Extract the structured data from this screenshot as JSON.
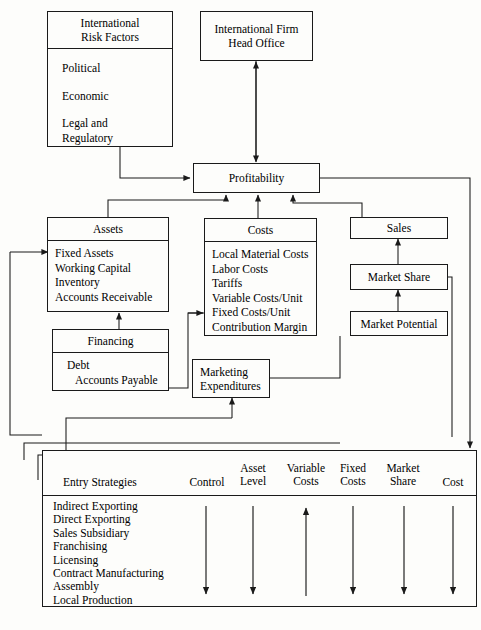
{
  "diagram": {
    "boxes": {
      "risk_factors": {
        "title": "International\nRisk Factors",
        "items": [
          "Political",
          "Economic",
          "Legal and\nRegulatory"
        ]
      },
      "head_office": {
        "label": "International Firm\nHead Office"
      },
      "profitability": {
        "label": "Profitability"
      },
      "assets": {
        "title": "Assets",
        "items": [
          "Fixed Assets",
          "Working Capital",
          "Inventory",
          "Accounts Receivable"
        ]
      },
      "financing": {
        "title": "Financing",
        "items": [
          "Debt",
          "Accounts Payable"
        ]
      },
      "costs": {
        "title": "Costs",
        "items": [
          "Local Material Costs",
          "Labor Costs",
          "Tariffs",
          "Variable Costs/Unit",
          "Fixed Costs/Unit",
          "Contribution Margin"
        ]
      },
      "sales": {
        "label": "Sales"
      },
      "market_share": {
        "label": "Market Share"
      },
      "market_potential": {
        "label": "Market Potential"
      },
      "marketing_expenditures": {
        "label": "Marketing\nExpenditures"
      }
    },
    "table": {
      "columns": [
        "Entry Strategies",
        "Control",
        "Asset\nLevel",
        "Variable\nCosts",
        "Fixed\nCosts",
        "Market\nShare",
        "Cost"
      ],
      "strategies": [
        "Indirect Exporting",
        "Direct Exporting",
        "Sales Subsidiary",
        "Franchising",
        "Licensing",
        "Contract Manufacturing",
        "Assembly",
        "Local Production"
      ],
      "column_arrow_directions": [
        "",
        "down",
        "down",
        "up",
        "down",
        "down",
        "down"
      ]
    },
    "caption": "",
    "colors": {
      "line": "#1a1a1a",
      "background": "#fdfdfb",
      "text": "#111111"
    }
  }
}
